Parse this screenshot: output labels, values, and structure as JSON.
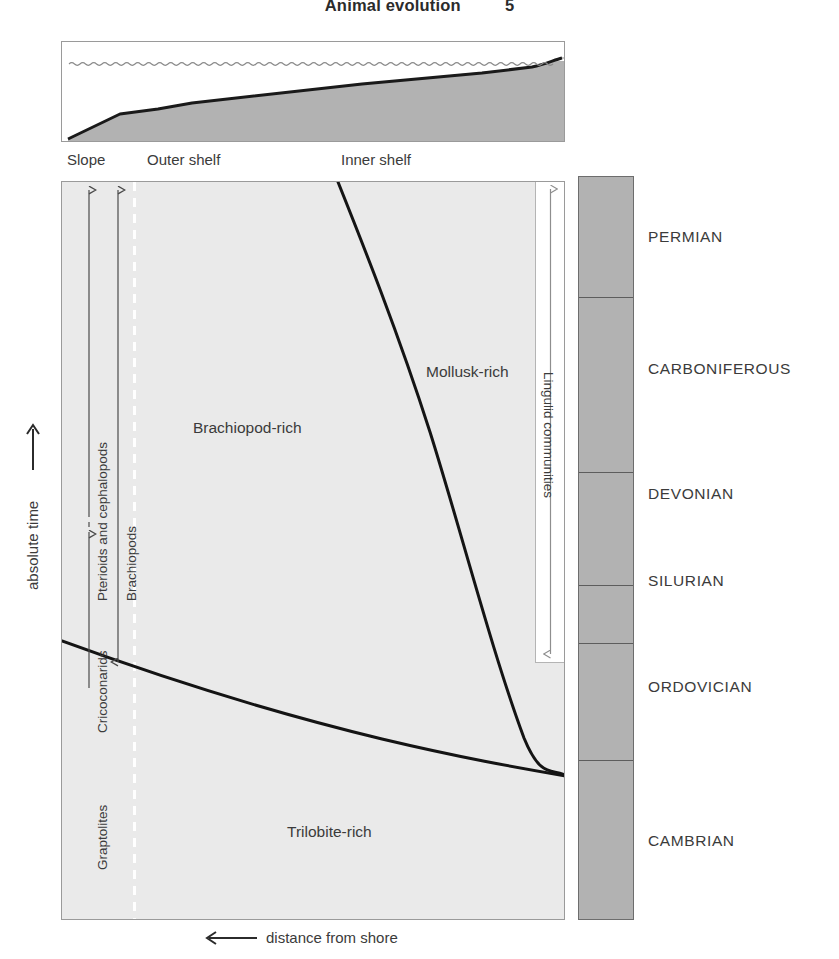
{
  "running_head": {
    "title": "Animal evolution",
    "page_number": "5"
  },
  "cross_section": {
    "zone_labels": [
      "Slope",
      "Outer shelf",
      "Inner shelf"
    ],
    "sea_label": "sea surface (wave line)",
    "sediment_color": "#b2b2b2",
    "water_color": "#ffffff"
  },
  "axes": {
    "y_caption": "absolute time",
    "y_arrow": "up-arrow",
    "x_caption": "distance from shore",
    "x_arrow": "left-arrow"
  },
  "main_plot": {
    "background_color": "#eaeaea",
    "field_labels": [
      {
        "text": "Brachiopod-rich",
        "x": 192,
        "y": 418
      },
      {
        "text": "Mollusk-rich",
        "x": 425,
        "y": 362
      },
      {
        "text": "Trilobite-rich",
        "x": 286,
        "y": 822
      }
    ],
    "dashed_line": {
      "name": "slope-shelf-break",
      "color": "#ffffff",
      "x": 133
    }
  },
  "range_bars": [
    {
      "name": "graptolites",
      "label": "Graptolites",
      "arrow": "double-headed-vertical",
      "top_arrow": "up",
      "bottom_arrow": "down"
    },
    {
      "name": "cricoconarids",
      "label": "Cricoconarids",
      "arrow": "double-headed-vertical-dashed"
    },
    {
      "name": "pterioids-and-cephalopods",
      "label": "Pterioids and cephalopods",
      "arrow": "up"
    },
    {
      "name": "brachiopods",
      "label": "Brachiopods",
      "arrow": "double-headed-vertical"
    },
    {
      "name": "lingulid-communities",
      "label": "Lingulid communities",
      "arrow": "double-headed-vertical"
    }
  ],
  "geologic_column": {
    "band_color": "#b2b2b2",
    "bands": [
      {
        "name": "PERMIAN",
        "top": 0,
        "height": 121
      },
      {
        "name": "CARBONIFEROUS",
        "top": 121,
        "height": 175
      },
      {
        "name": "DEVONIAN",
        "top": 296,
        "height": 113
      },
      {
        "name": "SILURIAN",
        "top": 409,
        "height": 58
      },
      {
        "name": "ORDOVICIAN",
        "top": 467,
        "height": 117
      },
      {
        "name": "CAMBRIAN",
        "top": 584,
        "height": 158
      }
    ],
    "label_positions": [
      62,
      201,
      333,
      432,
      522,
      676
    ]
  },
  "chart_data": {
    "type": "area",
    "xlabel": "distance from shore",
    "ylabel": "absolute time",
    "xlabel_direction": "increases to the left",
    "ylabel_direction": "increases upward",
    "grid": false,
    "legend": "none",
    "x_zones": [
      "Slope",
      "Outer shelf",
      "Inner shelf"
    ],
    "y_periods": [
      "CAMBRIAN",
      "ORDOVICIAN",
      "SILURIAN",
      "DEVONIAN",
      "CARBONIFEROUS",
      "PERMIAN"
    ],
    "fields": [
      {
        "name": "Trilobite-rich",
        "position": "lower half, offshore-to-onshore, retreating upward"
      },
      {
        "name": "Brachiopod-rich",
        "position": "central and left (offshore) region"
      },
      {
        "name": "Mollusk-rich",
        "position": "right (nearshore) region, expanding offshore upward"
      }
    ],
    "boundaries": [
      {
        "name": "brachiopod-mollusk-boundary",
        "note": "concave curve sweeping from upper-left (Permian, outer shelf) down to lower-right (Cambrian, inner shelf)",
        "points": [
          [
            337,
            181
          ],
          [
            360,
            230
          ],
          [
            392,
            300
          ],
          [
            420,
            370
          ],
          [
            444,
            440
          ],
          [
            470,
            530
          ],
          [
            500,
            630
          ],
          [
            528,
            720
          ],
          [
            552,
            760
          ],
          [
            565,
            775
          ]
        ]
      },
      {
        "name": "trilobite-brachiopod-boundary",
        "note": "gently descending line from slope (Ordovician) toward inner shelf (Cambrian)",
        "points": [
          [
            61,
            640
          ],
          [
            160,
            675
          ],
          [
            260,
            707
          ],
          [
            360,
            732
          ],
          [
            450,
            752
          ],
          [
            510,
            765
          ],
          [
            545,
            772
          ],
          [
            565,
            775
          ]
        ]
      }
    ],
    "range_bars": [
      {
        "name": "Graptolites",
        "x": 88,
        "from_y": 690,
        "to_y": 190,
        "style": "double-headed"
      },
      {
        "name": "Cricoconarids",
        "x": 88,
        "from_y": 555,
        "to_y": 500,
        "style": "dashed-double-headed"
      },
      {
        "name": "Pterioids and cephalopods",
        "x": 88,
        "from_y": 500,
        "to_y": 190,
        "style": "single-up"
      },
      {
        "name": "Brachiopods",
        "x": 117,
        "from_y": 660,
        "to_y": 190,
        "style": "double-headed"
      },
      {
        "name": "Lingulid communities",
        "x": 545,
        "from_y": 185,
        "to_y": 658,
        "style": "double-headed"
      }
    ]
  }
}
